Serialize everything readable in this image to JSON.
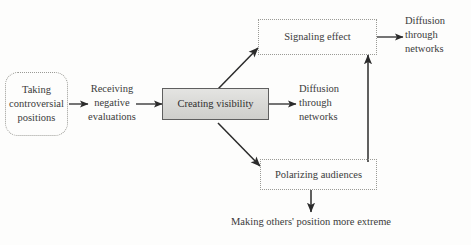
{
  "diagram": {
    "background_color": "#fdfdfc",
    "text_color": "#3b3b3b",
    "accent_fill": "#d8d8d5",
    "border_color": "#9a9a95",
    "nodes": {
      "taking_controversial_positions": {
        "line1": "Taking",
        "line2": "controversial",
        "line3": "positions",
        "style": "dotted-rounded"
      },
      "receiving_negative_evaluations": {
        "line1": "Receiving",
        "line2": "negative",
        "line3": "evaluations",
        "style": "plain-text"
      },
      "creating_visibility": {
        "line1": "Creating visibility",
        "style": "solid-gray-filled"
      },
      "signaling_effect": {
        "line1": "Signaling effect",
        "style": "dotted-rectangle"
      },
      "polarizing_audiences": {
        "line1": "Polarizing audiences",
        "style": "dotted-rectangle"
      }
    },
    "labels": {
      "diffusion_top": {
        "line1": "Diffusion",
        "line2": "through",
        "line3": "networks"
      },
      "diffusion_middle": {
        "line1": "Diffusion",
        "line2": "through",
        "line3": "networks"
      },
      "making_others_extreme": {
        "line1": "Making others' position more extreme"
      }
    },
    "connectors": [
      {
        "name": "taking-to-receiving",
        "from": "taking_controversial_positions",
        "to": "receiving_negative_evaluations",
        "direction": "right"
      },
      {
        "name": "receiving-to-creating",
        "from": "receiving_negative_evaluations",
        "to": "creating_visibility",
        "direction": "right"
      },
      {
        "name": "creating-to-signaling",
        "from": "creating_visibility",
        "to": "signaling_effect",
        "direction": "up-right-diagonal"
      },
      {
        "name": "creating-to-polarizing",
        "from": "creating_visibility",
        "to": "polarizing_audiences",
        "direction": "down-right-diagonal"
      },
      {
        "name": "creating-to-diffusion-middle",
        "from": "creating_visibility",
        "to": "diffusion_middle",
        "direction": "right"
      },
      {
        "name": "signaling-to-diffusion-top",
        "from": "signaling_effect",
        "to": "diffusion_top",
        "direction": "right"
      },
      {
        "name": "polarizing-to-signaling",
        "from": "polarizing_audiences",
        "to": "signaling_effect",
        "direction": "up"
      },
      {
        "name": "polarizing-to-making-others-extreme",
        "from": "polarizing_audiences",
        "to": "making_others_extreme",
        "direction": "down"
      }
    ]
  }
}
